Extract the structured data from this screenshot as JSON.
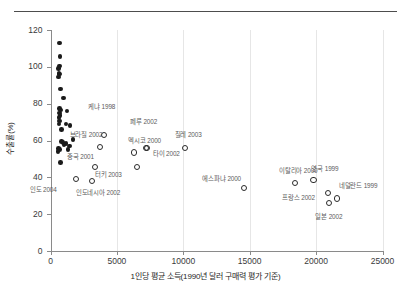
{
  "chart_data": {
    "type": "scatter",
    "title": "",
    "xlabel": "1인당 평균 소득(1990년 달러 구매력 평가 기준)",
    "ylabel": "수출률(%)",
    "xlim": [
      0,
      25000
    ],
    "ylim": [
      0,
      120
    ],
    "xticks": [
      0,
      5000,
      10000,
      15000,
      20000,
      25000
    ],
    "xtick_labels": [
      "0",
      "5000",
      "10000",
      "15000",
      "20000",
      "25000"
    ],
    "yticks": [
      0,
      20,
      40,
      60,
      80,
      100,
      120
    ],
    "ytick_labels": [
      "0",
      "20",
      "40",
      "60",
      "80",
      "100",
      "120"
    ],
    "grid": "vertical-light",
    "legend": "none",
    "series": [
      {
        "name": "unlabeled-developing",
        "marker": "filled-circle",
        "color": "#1a1a1a",
        "points": [
          {
            "x": 680,
            "y": 113.0
          },
          {
            "x": 720,
            "y": 105.5
          },
          {
            "x": 700,
            "y": 100.5
          },
          {
            "x": 620,
            "y": 99.0
          },
          {
            "x": 640,
            "y": 96.5
          },
          {
            "x": 700,
            "y": 96.0
          },
          {
            "x": 610,
            "y": 94.5
          },
          {
            "x": 760,
            "y": 88.0
          },
          {
            "x": 980,
            "y": 83.0
          },
          {
            "x": 700,
            "y": 77.5
          },
          {
            "x": 760,
            "y": 76.5
          },
          {
            "x": 1230,
            "y": 76.0
          },
          {
            "x": 700,
            "y": 75.0
          },
          {
            "x": 730,
            "y": 73.5
          },
          {
            "x": 640,
            "y": 72.5
          },
          {
            "x": 700,
            "y": 70.5
          },
          {
            "x": 640,
            "y": 69.0
          },
          {
            "x": 1180,
            "y": 69.0
          },
          {
            "x": 1480,
            "y": 68.0
          },
          {
            "x": 820,
            "y": 66.0
          },
          {
            "x": 1680,
            "y": 60.5
          },
          {
            "x": 830,
            "y": 59.5
          },
          {
            "x": 930,
            "y": 59.0
          },
          {
            "x": 1180,
            "y": 58.5
          },
          {
            "x": 1020,
            "y": 57.5
          },
          {
            "x": 1420,
            "y": 57.0
          },
          {
            "x": 620,
            "y": 55.5
          },
          {
            "x": 700,
            "y": 55.0
          },
          {
            "x": 1330,
            "y": 55.0
          },
          {
            "x": 580,
            "y": 54.0
          },
          {
            "x": 760,
            "y": 48.0
          }
        ]
      },
      {
        "name": "labeled-countries",
        "marker": "open-circle",
        "color": "#2b2b2b",
        "points": [
          {
            "x": 1900,
            "y": 39.0,
            "label": "인도 2004",
            "lx": -46,
            "ly": 10
          },
          {
            "x": 3100,
            "y": 38.0,
            "label": "인도네시아 2002",
            "lx": -16,
            "ly": 11
          },
          {
            "x": 3350,
            "y": 45.5,
            "label": "중국 2001",
            "lx": -28,
            "ly": -11
          },
          {
            "x": 3700,
            "y": 56.5,
            "label": "브라질 2002",
            "lx": -30,
            "ly": -12
          },
          {
            "x": 4050,
            "y": 63.0,
            "label": "케냐 1998",
            "lx": -16,
            "ly": -28
          },
          {
            "x": 6300,
            "y": 53.5,
            "label": "멕시코 2000",
            "lx": -6,
            "ly": -12
          },
          {
            "x": 6500,
            "y": 45.5,
            "label": "터키 2003",
            "lx": -42,
            "ly": 7
          },
          {
            "x": 7200,
            "y": 56.0,
            "label": "페루 2002",
            "lx": -16,
            "ly": -26
          },
          {
            "x": 7250,
            "y": 55.8,
            "label": "타이 2002",
            "lx": 6,
            "ly": 5
          },
          {
            "x": 10100,
            "y": 56.0,
            "label": "칠레 2003",
            "lx": -10,
            "ly": -13
          },
          {
            "x": 14600,
            "y": 34.0,
            "label": "에스파냐 2000",
            "lx": -42,
            "ly": -10
          },
          {
            "x": 18400,
            "y": 37.0,
            "label": "이탈리아 2000",
            "lx": -16,
            "ly": -12
          },
          {
            "x": 19800,
            "y": 38.5,
            "label": "영국 1999",
            "lx": -2,
            "ly": -12
          },
          {
            "x": 20900,
            "y": 31.5,
            "label": "프랑스 2002",
            "lx": -46,
            "ly": 5
          },
          {
            "x": 21000,
            "y": 26.0,
            "label": "일본 2002",
            "lx": -14,
            "ly": 13
          },
          {
            "x": 21550,
            "y": 28.5,
            "label": "네덜란드 1999",
            "lx": 2,
            "ly": -13
          }
        ]
      }
    ]
  }
}
